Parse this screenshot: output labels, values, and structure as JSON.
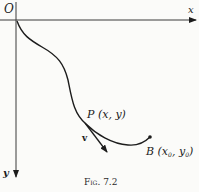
{
  "figure": {
    "caption": "Fig. 7.2",
    "labels": {
      "origin": "O",
      "x_axis": "x",
      "y_axis": "y",
      "point_p": "P (x, y)",
      "velocity": "v",
      "point_b_prefix": "B (x",
      "point_b_sub1": "0",
      "point_b_mid": ", y",
      "point_b_sub2": "0",
      "point_b_suffix": ")"
    },
    "elements": {
      "axes": "x axis horizontal rightward, y axis vertical downward, origin top-left",
      "curve": "path from O descending through P and ending at B",
      "tangent": "velocity vector v tangent to curve at P"
    },
    "colors": {
      "ink": "#1c1c1c",
      "paper": "#fbfbf9"
    }
  }
}
